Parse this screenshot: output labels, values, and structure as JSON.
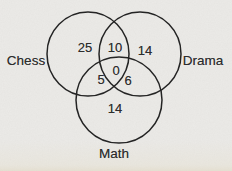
{
  "figure": {
    "type": "three-set venn diagram",
    "sets": {
      "left": {
        "label": "Chess"
      },
      "right": {
        "label": "Drama"
      },
      "bottom": {
        "label": "Math"
      }
    },
    "regions": {
      "chess_only": "25",
      "chess_and_drama": "10",
      "drama_only": "14",
      "chess_and_math": "5",
      "all_three": "0",
      "drama_and_math": "6",
      "math_only": "14"
    },
    "colors": {
      "paper_background": "#ecebe8",
      "paper_bottom_tint": "#e5dfcd",
      "circle_stroke": "#242424",
      "text": "#2d2d2d"
    }
  }
}
